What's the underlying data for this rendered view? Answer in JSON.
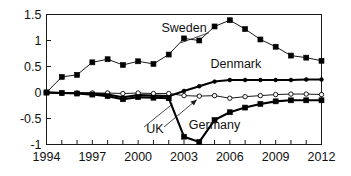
{
  "chart_data": {
    "type": "line",
    "title": "",
    "subtitle": "",
    "xlabel": "",
    "ylabel": "",
    "xlim": [
      1994,
      2012
    ],
    "ylim": [
      -1,
      1.5
    ],
    "grid": false,
    "legend_position": "inline-annotations",
    "yticks": [
      "1.5",
      "1",
      "0.5",
      "0",
      "-0.5",
      "-1"
    ],
    "ytick_values": [
      1.5,
      1,
      0.5,
      0,
      -0.5,
      -1
    ],
    "xticks": [
      "1994",
      "1997",
      "2000",
      "2003",
      "2006",
      "2009",
      "2012"
    ],
    "xtick_values": [
      1994,
      1997,
      2000,
      2003,
      2006,
      2009,
      2012
    ],
    "x": [
      1994,
      1995,
      1996,
      1997,
      1998,
      1999,
      2000,
      2001,
      2002,
      2003,
      2004,
      2005,
      2006,
      2007,
      2008,
      2009,
      2010,
      2011,
      2012
    ],
    "series": [
      {
        "name": "Sweden",
        "marker": "filled-square",
        "line_weight": "thin",
        "color": "#000000",
        "values": [
          0.0,
          0.3,
          0.34,
          0.58,
          0.64,
          0.53,
          0.6,
          0.55,
          0.73,
          1.04,
          1.0,
          1.27,
          1.39,
          1.22,
          1.02,
          0.88,
          0.71,
          0.67,
          0.61
        ]
      },
      {
        "name": "Denmark",
        "marker": "filled-dot",
        "line_weight": "bold",
        "color": "#000000",
        "values": [
          0.0,
          -0.01,
          -0.01,
          -0.02,
          -0.04,
          -0.09,
          -0.05,
          -0.06,
          -0.07,
          0.03,
          0.12,
          0.21,
          0.24,
          0.24,
          0.24,
          0.24,
          0.24,
          0.25,
          0.25
        ]
      },
      {
        "name": "UK",
        "marker": "open-circle",
        "line_weight": "thin",
        "color": "#000000",
        "values": [
          0.0,
          -0.01,
          -0.01,
          -0.01,
          -0.01,
          -0.02,
          -0.01,
          -0.02,
          -0.02,
          -0.06,
          -0.07,
          -0.06,
          -0.11,
          -0.08,
          -0.06,
          -0.04,
          -0.03,
          -0.03,
          -0.04
        ]
      },
      {
        "name": "Germany",
        "marker": "filled-square",
        "line_weight": "bold",
        "color": "#000000",
        "values": [
          0.0,
          -0.01,
          -0.02,
          -0.04,
          -0.07,
          -0.13,
          -0.09,
          -0.1,
          -0.11,
          -0.85,
          -0.95,
          -0.53,
          -0.38,
          -0.29,
          -0.22,
          -0.17,
          -0.15,
          -0.15,
          -0.15
        ]
      }
    ],
    "annotations": [
      {
        "text": "Sweden",
        "x": 2003.0,
        "y": 1.17,
        "leader": true
      },
      {
        "text": "Denmark",
        "x": 2006.4,
        "y": 0.48,
        "leader": false
      },
      {
        "text": "UK",
        "x": 2001.1,
        "y": -0.78,
        "leader": true
      },
      {
        "text": "Germany",
        "x": 2005.0,
        "y": -0.7,
        "leader": false
      }
    ]
  }
}
